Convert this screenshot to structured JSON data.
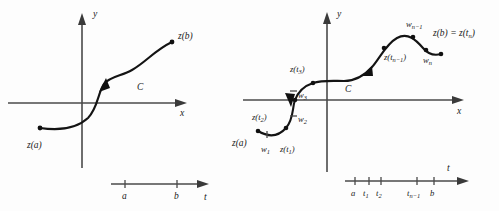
{
  "figure": {
    "background_color": "#fdfdfd",
    "ink_color": "#141414",
    "axis_color": "#4a4a4a"
  },
  "left_panel": {
    "name": "smooth-contour-panel",
    "axes": {
      "x_label": "x",
      "y_label": "y"
    },
    "curve_label": "C",
    "endpoint_start_label": "z(a)",
    "endpoint_end_label": "z(b)",
    "parameter_axis": {
      "axis_label": "t",
      "ticks": [
        "a",
        "b"
      ]
    }
  },
  "right_panel": {
    "name": "partitioned-contour-panel",
    "axes": {
      "x_label": "x",
      "y_label": "y"
    },
    "curve_label": "C",
    "endpoint_start_label": "z(a)",
    "endpoint_end_label_main": "z(b) = z(t",
    "endpoint_end_label_sub": "n",
    "endpoint_end_label_tail": ")",
    "point_labels": [
      {
        "base": "w",
        "sub": "1"
      },
      {
        "base": "w",
        "sub": "2"
      },
      {
        "base": "w",
        "sub": "3"
      },
      {
        "base": "w",
        "sub": "n−1"
      },
      {
        "base": "w",
        "sub": "n"
      }
    ],
    "image_labels": [
      {
        "main": "z(t",
        "sub": "1",
        "tail": ")"
      },
      {
        "main": "z(t",
        "sub": "2",
        "tail": ")"
      },
      {
        "main": "z(t",
        "sub": "3",
        "tail": ")"
      },
      {
        "main": "z(t",
        "sub": "n−1",
        "tail": ")"
      }
    ],
    "parameter_axis": {
      "axis_label": "t",
      "ticks": [
        {
          "base": "a",
          "sub": ""
        },
        {
          "base": "t",
          "sub": "1"
        },
        {
          "base": "t",
          "sub": "2"
        },
        {
          "base": "t",
          "sub": "n−1"
        },
        {
          "base": "b",
          "sub": ""
        }
      ]
    }
  }
}
